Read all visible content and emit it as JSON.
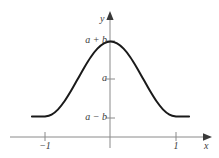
{
  "figure": {
    "name": "raised-cosine-graph",
    "background_color": "#ffffff",
    "axis_color": "#8a8a8a",
    "curve_color": "#1a1a1a",
    "label_color": "#3c3c3c"
  },
  "axes": {
    "x_axis_name": "x",
    "y_axis_name": "y"
  },
  "labels": {
    "a_plus_b": "a + b",
    "a": "a",
    "a_minus_b": "a − b",
    "neg_one": "−1",
    "one": "1"
  },
  "chart_data": {
    "type": "line",
    "title": "",
    "xlabel": "x",
    "ylabel": "y",
    "grid": false,
    "legend": null,
    "xlim": [
      -1.35,
      1.35
    ],
    "ylim": [
      -0.45,
      1.45
    ],
    "xticks": [
      -1,
      1
    ],
    "xticklabels": [
      "−1",
      "1"
    ],
    "yticks": [
      -1,
      0,
      1
    ],
    "yticklabels": [
      "a − b",
      "a",
      "a + b"
    ],
    "annotations": [
      {
        "text": "a + b",
        "x": 0,
        "y": 1,
        "note": "maximum value of curve at x = 0"
      },
      {
        "text": "a",
        "x": 0,
        "y": 0,
        "note": "midline / mean value"
      },
      {
        "text": "a − b",
        "x": 0,
        "y": -1,
        "note": "minimum value of curve at x = ±1"
      }
    ],
    "series": [
      {
        "name": "y = a + b·cos(πx)",
        "comment": "values given in units of b above the midline a; y=1 means a+b, y=-1 means a−b",
        "x": [
          -1.2,
          -1.1,
          -1.0,
          -0.9,
          -0.8,
          -0.7,
          -0.6,
          -0.5,
          -0.4,
          -0.3,
          -0.2,
          -0.1,
          0.0,
          0.1,
          0.2,
          0.3,
          0.4,
          0.5,
          0.6,
          0.7,
          0.8,
          0.9,
          1.0,
          1.1,
          1.2
        ],
        "values": [
          -1.0,
          -1.0,
          -1.0,
          -0.951,
          -0.809,
          -0.588,
          -0.309,
          0.0,
          0.309,
          0.588,
          0.809,
          0.951,
          1.0,
          0.951,
          0.809,
          0.588,
          0.309,
          0.0,
          -0.309,
          -0.588,
          -0.809,
          -0.951,
          -1.0,
          -1.0,
          -1.0
        ]
      }
    ]
  }
}
